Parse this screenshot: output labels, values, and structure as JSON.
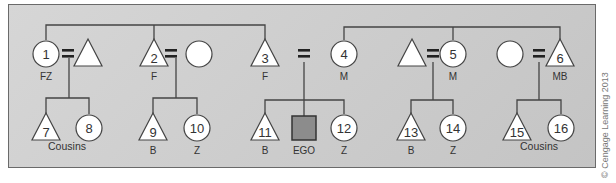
{
  "colors": {
    "line": "#444444",
    "node_fill": "#ffffff",
    "ego_fill": "#8c8c8c",
    "text": "#333333"
  },
  "nodes": [
    {
      "id": "1",
      "shape": "circle",
      "x": 46,
      "y": 54,
      "number": "1",
      "label": "FZ"
    },
    {
      "id": "1h",
      "shape": "triangle",
      "x": 88,
      "y": 54,
      "number": "",
      "label": ""
    },
    {
      "id": "2",
      "shape": "triangle",
      "x": 154,
      "y": 54,
      "number": "2",
      "label": "F"
    },
    {
      "id": "2w",
      "shape": "circle",
      "x": 199,
      "y": 54,
      "number": "",
      "label": ""
    },
    {
      "id": "3",
      "shape": "triangle",
      "x": 265,
      "y": 54,
      "number": "3",
      "label": "F"
    },
    {
      "id": "4",
      "shape": "circle",
      "x": 344,
      "y": 54,
      "number": "4",
      "label": "M"
    },
    {
      "id": "5h",
      "shape": "triangle",
      "x": 412,
      "y": 54,
      "number": "",
      "label": ""
    },
    {
      "id": "5",
      "shape": "circle",
      "x": 453,
      "y": 54,
      "number": "5",
      "label": "M"
    },
    {
      "id": "6w",
      "shape": "circle",
      "x": 510,
      "y": 54,
      "number": "",
      "label": ""
    },
    {
      "id": "6",
      "shape": "triangle",
      "x": 560,
      "y": 54,
      "number": "6",
      "label": "MB"
    },
    {
      "id": "7",
      "shape": "triangle",
      "x": 46,
      "y": 128,
      "number": "7",
      "label": ""
    },
    {
      "id": "8",
      "shape": "circle",
      "x": 89,
      "y": 128,
      "number": "8",
      "label": ""
    },
    {
      "id": "9",
      "shape": "triangle",
      "x": 153,
      "y": 128,
      "number": "9",
      "label": "B"
    },
    {
      "id": "10",
      "shape": "circle",
      "x": 197,
      "y": 128,
      "number": "10",
      "label": "Z"
    },
    {
      "id": "11",
      "shape": "triangle",
      "x": 265,
      "y": 128,
      "number": "11",
      "label": "B"
    },
    {
      "id": "ego",
      "shape": "square",
      "x": 304,
      "y": 128,
      "number": "",
      "label": "EGO"
    },
    {
      "id": "12",
      "shape": "circle",
      "x": 344,
      "y": 128,
      "number": "12",
      "label": "Z"
    },
    {
      "id": "13",
      "shape": "triangle",
      "x": 411,
      "y": 128,
      "number": "13",
      "label": "B"
    },
    {
      "id": "14",
      "shape": "circle",
      "x": 453,
      "y": 128,
      "number": "14",
      "label": "Z"
    },
    {
      "id": "15",
      "shape": "triangle",
      "x": 517,
      "y": 128,
      "number": "15",
      "label": ""
    },
    {
      "id": "16",
      "shape": "circle",
      "x": 561,
      "y": 128,
      "number": "16",
      "label": ""
    }
  ],
  "group_labels": [
    {
      "text": "Cousins",
      "x": 67,
      "y": 150
    },
    {
      "text": "Cousins",
      "x": 539,
      "y": 150
    }
  ],
  "marriages": [
    {
      "x": 68,
      "y": 54
    },
    {
      "x": 171,
      "y": 54
    },
    {
      "x": 304,
      "y": 54
    },
    {
      "x": 433,
      "y": 54
    },
    {
      "x": 539,
      "y": 54
    }
  ],
  "credit": "© Cengage Learning 2013"
}
